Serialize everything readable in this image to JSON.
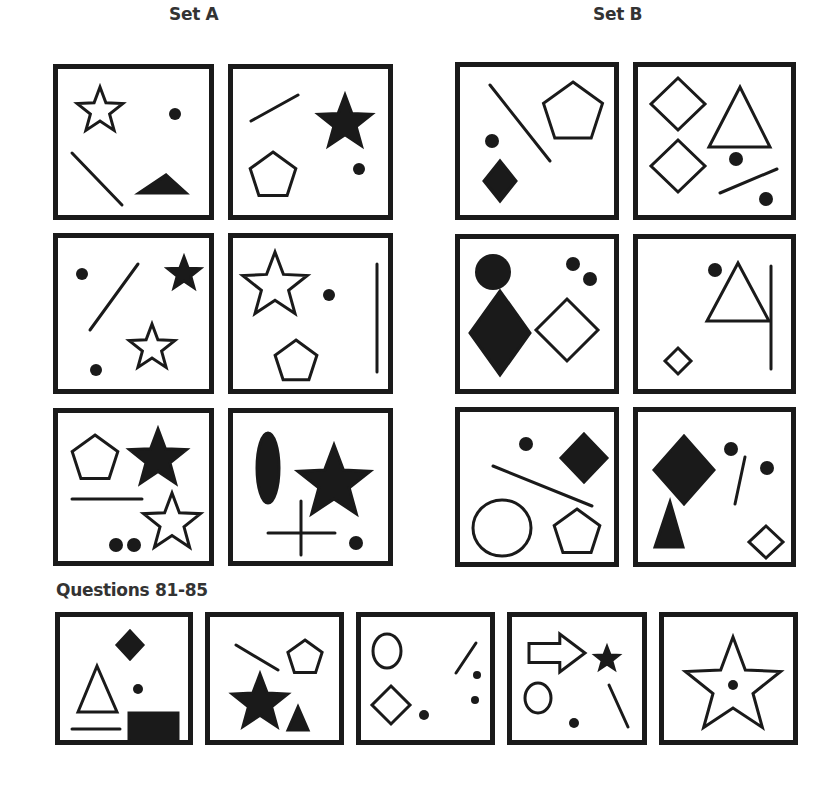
{
  "headings": {
    "set_a": "Set A",
    "set_b": "Set B",
    "questions": "Questions 81-85"
  },
  "colors": {
    "ink": "#1a1a1a",
    "heading": "#333333",
    "background": "#ffffff"
  },
  "panels": [
    {
      "id": "set-a-1",
      "group": "Set A",
      "x": 53,
      "y": 64,
      "w": 161,
      "h": 156,
      "shapes": [
        {
          "type": "star",
          "cx": 42,
          "cy": 42,
          "r": 24,
          "fill": false
        },
        {
          "type": "dot",
          "cx": 117,
          "cy": 45,
          "r": 6
        },
        {
          "type": "line",
          "x1": 14,
          "y1": 84,
          "x2": 64,
          "y2": 136
        },
        {
          "type": "triangle",
          "points": "81,124 108,106 128,124",
          "fill": true
        }
      ]
    },
    {
      "id": "set-a-2",
      "group": "Set A",
      "x": 228,
      "y": 64,
      "w": 165,
      "h": 156,
      "shapes": [
        {
          "type": "line",
          "x1": 18,
          "y1": 52,
          "x2": 65,
          "y2": 26
        },
        {
          "type": "star",
          "cx": 112,
          "cy": 54,
          "r": 28,
          "fill": true
        },
        {
          "type": "pentagon",
          "cx": 40,
          "cy": 107,
          "r": 24,
          "fill": false
        },
        {
          "type": "dot",
          "cx": 126,
          "cy": 100,
          "r": 6
        }
      ]
    },
    {
      "id": "set-a-3",
      "group": "Set A",
      "x": 53,
      "y": 233,
      "w": 161,
      "h": 161,
      "shapes": [
        {
          "type": "dot",
          "cx": 24,
          "cy": 36,
          "r": 6
        },
        {
          "type": "line",
          "x1": 32,
          "y1": 92,
          "x2": 80,
          "y2": 26
        },
        {
          "type": "star",
          "cx": 126,
          "cy": 36,
          "r": 17,
          "fill": true
        },
        {
          "type": "star",
          "cx": 94,
          "cy": 110,
          "r": 24,
          "fill": false
        },
        {
          "type": "dot",
          "cx": 38,
          "cy": 132,
          "r": 6
        }
      ]
    },
    {
      "id": "set-a-4",
      "group": "Set A",
      "x": 228,
      "y": 233,
      "w": 165,
      "h": 161,
      "shapes": [
        {
          "type": "star",
          "cx": 42,
          "cy": 48,
          "r": 34,
          "fill": false
        },
        {
          "type": "dot",
          "cx": 96,
          "cy": 57,
          "r": 6
        },
        {
          "type": "pentagon",
          "cx": 63,
          "cy": 124,
          "r": 22,
          "fill": false
        },
        {
          "type": "line",
          "x1": 144,
          "y1": 26,
          "x2": 144,
          "y2": 134
        }
      ]
    },
    {
      "id": "set-a-5",
      "group": "Set A",
      "x": 53,
      "y": 408,
      "w": 161,
      "h": 158,
      "shapes": [
        {
          "type": "pentagon",
          "cx": 37,
          "cy": 46,
          "r": 24,
          "fill": false
        },
        {
          "type": "star",
          "cx": 100,
          "cy": 46,
          "r": 30,
          "fill": true
        },
        {
          "type": "line",
          "x1": 14,
          "y1": 86,
          "x2": 84,
          "y2": 86
        },
        {
          "type": "star",
          "cx": 114,
          "cy": 110,
          "r": 30,
          "fill": false
        },
        {
          "type": "dot",
          "cx": 58,
          "cy": 132,
          "r": 7
        },
        {
          "type": "dot",
          "cx": 76,
          "cy": 132,
          "r": 7
        }
      ]
    },
    {
      "id": "set-a-6",
      "group": "Set A",
      "x": 228,
      "y": 408,
      "w": 165,
      "h": 158,
      "shapes": [
        {
          "type": "ellipse",
          "cx": 35,
          "cy": 55,
          "rx": 11,
          "ry": 35,
          "fill": true
        },
        {
          "type": "star",
          "cx": 101,
          "cy": 70,
          "r": 38,
          "fill": true
        },
        {
          "type": "line",
          "x1": 35,
          "y1": 120,
          "x2": 102,
          "y2": 120
        },
        {
          "type": "line",
          "x1": 68,
          "y1": 88,
          "x2": 68,
          "y2": 142
        },
        {
          "type": "dot",
          "cx": 123,
          "cy": 130,
          "r": 7
        }
      ]
    },
    {
      "id": "set-b-1",
      "group": "Set B",
      "x": 455,
      "y": 62,
      "w": 164,
      "h": 158,
      "shapes": [
        {
          "type": "line",
          "x1": 30,
          "y1": 18,
          "x2": 90,
          "y2": 94
        },
        {
          "type": "pentagon",
          "cx": 113,
          "cy": 46,
          "r": 31,
          "fill": false
        },
        {
          "type": "dot",
          "cx": 32,
          "cy": 74,
          "r": 7
        },
        {
          "type": "diamond",
          "cx": 40,
          "cy": 114,
          "rx": 16,
          "ry": 20,
          "fill": true
        }
      ]
    },
    {
      "id": "set-b-2",
      "group": "Set B",
      "x": 633,
      "y": 62,
      "w": 163,
      "h": 158,
      "shapes": [
        {
          "type": "diamond",
          "cx": 40,
          "cy": 37,
          "rx": 27,
          "ry": 26,
          "fill": false
        },
        {
          "type": "triangle",
          "points": "71,80 102,20 132,80",
          "fill": false
        },
        {
          "type": "diamond",
          "cx": 40,
          "cy": 99,
          "rx": 27,
          "ry": 26,
          "fill": false
        },
        {
          "type": "dot",
          "cx": 98,
          "cy": 92,
          "r": 7
        },
        {
          "type": "line",
          "x1": 82,
          "y1": 126,
          "x2": 139,
          "y2": 102
        },
        {
          "type": "dot",
          "cx": 128,
          "cy": 132,
          "r": 7
        }
      ]
    },
    {
      "id": "set-b-3",
      "group": "Set B",
      "x": 455,
      "y": 234,
      "w": 164,
      "h": 160,
      "shapes": [
        {
          "type": "dot",
          "cx": 33,
          "cy": 33,
          "r": 18
        },
        {
          "type": "diamond",
          "cx": 40,
          "cy": 94,
          "rx": 30,
          "ry": 42,
          "fill": true
        },
        {
          "type": "dot",
          "cx": 113,
          "cy": 25,
          "r": 7
        },
        {
          "type": "dot",
          "cx": 130,
          "cy": 40,
          "r": 7
        },
        {
          "type": "diamond",
          "cx": 107,
          "cy": 91,
          "rx": 31,
          "ry": 31,
          "fill": false
        }
      ]
    },
    {
      "id": "set-b-4",
      "group": "Set B",
      "x": 633,
      "y": 234,
      "w": 163,
      "h": 160,
      "shapes": [
        {
          "type": "dot",
          "cx": 77,
          "cy": 31,
          "r": 7
        },
        {
          "type": "triangle",
          "points": "100,24 131,82 69,82",
          "fill": false
        },
        {
          "type": "line",
          "x1": 133,
          "y1": 27,
          "x2": 133,
          "y2": 130
        },
        {
          "type": "diamond",
          "cx": 40,
          "cy": 122,
          "rx": 13,
          "ry": 13,
          "fill": false
        }
      ]
    },
    {
      "id": "set-b-5",
      "group": "Set B",
      "x": 455,
      "y": 407,
      "w": 164,
      "h": 160,
      "shapes": [
        {
          "type": "dot",
          "cx": 66,
          "cy": 32,
          "r": 7
        },
        {
          "type": "diamond",
          "cx": 124,
          "cy": 46,
          "rx": 23,
          "ry": 24,
          "fill": true
        },
        {
          "type": "line",
          "x1": 33,
          "y1": 54,
          "x2": 132,
          "y2": 94
        },
        {
          "type": "ellipse",
          "cx": 42,
          "cy": 116,
          "rx": 29,
          "ry": 28,
          "fill": false
        },
        {
          "type": "pentagon",
          "cx": 117,
          "cy": 121,
          "r": 24,
          "fill": false
        }
      ]
    },
    {
      "id": "set-b-6",
      "group": "Set B",
      "x": 633,
      "y": 407,
      "w": 163,
      "h": 160,
      "shapes": [
        {
          "type": "diamond",
          "cx": 46,
          "cy": 58,
          "rx": 30,
          "ry": 34,
          "fill": true
        },
        {
          "type": "dot",
          "cx": 93,
          "cy": 37,
          "r": 7
        },
        {
          "type": "line",
          "x1": 107,
          "y1": 45,
          "x2": 97,
          "y2": 92
        },
        {
          "type": "dot",
          "cx": 129,
          "cy": 56,
          "r": 7
        },
        {
          "type": "triangle",
          "points": "17,135 32,90 45,135",
          "fill": true
        },
        {
          "type": "diamond",
          "cx": 128,
          "cy": 130,
          "rx": 17,
          "ry": 16,
          "fill": false
        }
      ]
    },
    {
      "id": "question-81",
      "group": "Questions 81-85",
      "x": 55,
      "y": 612,
      "w": 138,
      "h": 133,
      "shapes": [
        {
          "type": "diamond",
          "cx": 70,
          "cy": 28,
          "rx": 13,
          "ry": 14,
          "fill": true
        },
        {
          "type": "triangle",
          "points": "18,95 37,49 57,95",
          "fill": false
        },
        {
          "type": "dot",
          "cx": 78,
          "cy": 72,
          "r": 5
        },
        {
          "type": "line",
          "x1": 12,
          "y1": 112,
          "x2": 60,
          "y2": 112
        },
        {
          "type": "rect",
          "x": 69,
          "y": 96,
          "w": 49,
          "h": 28,
          "fill": true
        }
      ]
    },
    {
      "id": "question-82",
      "group": "Questions 81-85",
      "x": 205,
      "y": 612,
      "w": 139,
      "h": 133,
      "shapes": [
        {
          "type": "line",
          "x1": 26,
          "y1": 28,
          "x2": 68,
          "y2": 53
        },
        {
          "type": "pentagon",
          "cx": 95,
          "cy": 41,
          "r": 18,
          "fill": false
        },
        {
          "type": "star",
          "cx": 50,
          "cy": 86,
          "r": 29,
          "fill": true
        },
        {
          "type": "triangle",
          "points": "78,113 88,90 98,113",
          "fill": true
        }
      ]
    },
    {
      "id": "question-83",
      "group": "Questions 81-85",
      "x": 356,
      "y": 612,
      "w": 139,
      "h": 133,
      "shapes": [
        {
          "type": "ellipse",
          "cx": 26,
          "cy": 34,
          "rx": 14,
          "ry": 17,
          "fill": false
        },
        {
          "type": "line",
          "x1": 95,
          "y1": 56,
          "x2": 115,
          "y2": 26
        },
        {
          "type": "dot",
          "cx": 116,
          "cy": 58,
          "r": 4
        },
        {
          "type": "diamond",
          "cx": 30,
          "cy": 88,
          "rx": 19,
          "ry": 19,
          "fill": false
        },
        {
          "type": "dot",
          "cx": 63,
          "cy": 98,
          "r": 5
        },
        {
          "type": "dot",
          "cx": 114,
          "cy": 83,
          "r": 4
        }
      ]
    },
    {
      "id": "question-84",
      "group": "Questions 81-85",
      "x": 507,
      "y": 612,
      "w": 140,
      "h": 133,
      "shapes": [
        {
          "type": "arrow",
          "x": 17,
          "y": 17,
          "w": 56,
          "h": 38,
          "fill": false
        },
        {
          "type": "star",
          "cx": 95,
          "cy": 42,
          "r": 12,
          "fill": true
        },
        {
          "type": "ellipse",
          "cx": 26,
          "cy": 81,
          "rx": 13,
          "ry": 15,
          "fill": false
        },
        {
          "type": "line",
          "x1": 97,
          "y1": 68,
          "x2": 116,
          "y2": 110
        },
        {
          "type": "dot",
          "cx": 62,
          "cy": 106,
          "r": 5
        }
      ]
    },
    {
      "id": "question-85",
      "group": "Questions 81-85",
      "x": 659,
      "y": 612,
      "w": 139,
      "h": 133,
      "shapes": [
        {
          "type": "star",
          "cx": 69,
          "cy": 70,
          "r": 50,
          "fill": false
        },
        {
          "type": "dot",
          "cx": 69,
          "cy": 68,
          "r": 5
        }
      ]
    }
  ]
}
